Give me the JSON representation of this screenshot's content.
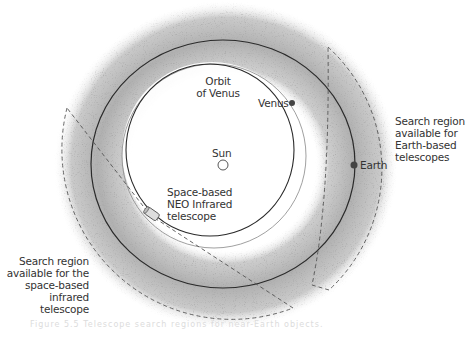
{
  "diagram": {
    "labels": {
      "orbit_of_venus": "Orbit\nof Venus",
      "venus": "Venus",
      "sun": "Sun",
      "earth": "Earth",
      "space_telescope": "Space-based\nNEO Infrared\ntelescope",
      "earth_search_region": "Search region\navailable for\nEarth-based\ntelescopes",
      "space_search_region": "Search region\navailable for the\nspace-based\ninfrared telescope"
    },
    "caption": "Figure 5.5  Telescope search regions for near-Earth objects.",
    "colors": {
      "orbit_line": "#2a2a2a",
      "thin_orbit": "#888888",
      "band": "#b5b5b5",
      "dashed": "#555555",
      "text": "#333333",
      "background": "#ffffff"
    },
    "bodies": [
      {
        "name": "Sun",
        "shape": "hollow-circle"
      },
      {
        "name": "Venus",
        "shape": "filled-dot"
      },
      {
        "name": "Earth",
        "shape": "filled-dot"
      },
      {
        "name": "Space-based NEO Infrared telescope",
        "shape": "cylinder"
      }
    ]
  }
}
